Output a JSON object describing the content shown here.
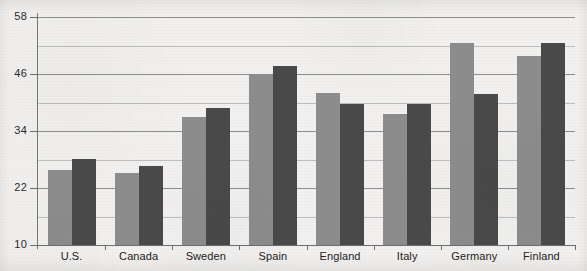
{
  "chart_data": {
    "type": "bar",
    "title": "",
    "subtitle": "",
    "xlabel": "",
    "ylabel": "",
    "ylim": [
      10,
      58
    ],
    "ytick_step": 12,
    "yticks": [
      10,
      22,
      34,
      46,
      58
    ],
    "ytick_labels": [
      "10",
      "22",
      "34",
      "46",
      "58"
    ],
    "minor_gridlines": [
      16,
      28,
      40,
      52
    ],
    "grid": true,
    "grid_axis": "y",
    "legend": "none",
    "legend_position": "none",
    "categories": [
      "U.S.",
      "Canada",
      "Sweden",
      "Spain",
      "England",
      "Italy",
      "Germany",
      "Finland"
    ],
    "series": [
      {
        "name": "Series 1",
        "color": "#8d8d8d",
        "values": [
          25.8,
          25.1,
          36.9,
          46.0,
          42.0,
          37.6,
          52.6,
          49.8
        ]
      },
      {
        "name": "Series 2",
        "color": "#4a4a4a",
        "values": [
          28.2,
          26.7,
          38.8,
          47.7,
          39.7,
          39.6,
          41.7,
          52.6
        ]
      }
    ]
  },
  "colors": {
    "background": "#f2f1ef",
    "series_light": "#8d8d8d",
    "series_dark": "#4a4a4a",
    "gridline_major": "#8e8e8e",
    "gridline_minor": "#bdbdbd",
    "axis": "#6e6e6e",
    "text": "#222222"
  }
}
